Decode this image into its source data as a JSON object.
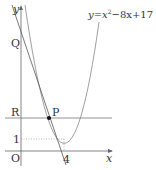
{
  "diagram": {
    "equation": {
      "y": "y",
      "eq": "=",
      "x": "x",
      "exp": "2",
      "rest": "−8x+17"
    },
    "labels": {
      "y_axis": "y",
      "x_axis": "x",
      "origin": "O",
      "Q": "Q",
      "R": "R",
      "P": "P",
      "one": "1",
      "four": "4"
    },
    "colors": {
      "axis": "#555555",
      "curve": "#777777",
      "tangent": "#555555",
      "point": "#111111"
    }
  }
}
